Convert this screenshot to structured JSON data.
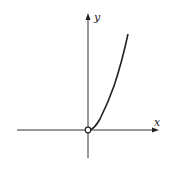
{
  "figure": {
    "axes": {
      "x_label": "x",
      "y_label": "y"
    },
    "curve": {
      "shape": "parabola-like, x > 0 branch",
      "start_point": "open circle at origin",
      "color": "#222222"
    },
    "colors": {
      "axis": "#333333",
      "curve": "#222222",
      "background": "#ffffff"
    }
  }
}
